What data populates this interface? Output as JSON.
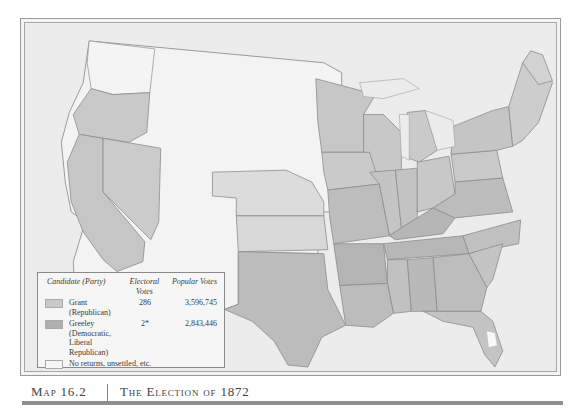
{
  "map": {
    "title": "The Election of 1872",
    "figure_number": "Map 16.2",
    "colors": {
      "grant": "#c9c9c9",
      "greeley": "#b3b3b3",
      "no_returns": "#f3f3f3",
      "water": "#e9e9e9",
      "border": "#8c8c8c"
    }
  },
  "legend": {
    "headers": {
      "candidate": "Candidate (Party)",
      "electoral": "Electoral Votes",
      "popular": "Popular Votes"
    },
    "rows": [
      {
        "candidate": "Grant (Republican)",
        "electoral": "286",
        "popular": "3,596,745",
        "swatch": "#c9c9c9"
      },
      {
        "candidate": "Greeley (Democratic, Liberal Republican)",
        "electoral": "2*",
        "popular": "2,843,446",
        "swatch": "#b0b0b0"
      },
      {
        "candidate": "No returns, unsettled, etc.",
        "electoral": "",
        "popular": "",
        "swatch": "#f6f6f6"
      }
    ],
    "footnote": "*Because of Greeley's death, his electoral votes were scattered among various candidates."
  },
  "caption": {
    "number": "Map 16.2",
    "title": "The Election of 1872"
  }
}
